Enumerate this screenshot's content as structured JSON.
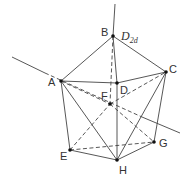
{
  "diagram": {
    "type": "polyhedron",
    "point_group_label": {
      "main": "D",
      "subscript": "2d"
    },
    "stroke_color": "#444444",
    "vertices": [
      {
        "id": "A",
        "label": "A",
        "x": 61,
        "y": 81,
        "lx": 48,
        "ly": 86
      },
      {
        "id": "B",
        "label": "B",
        "x": 113,
        "y": 36,
        "lx": 101,
        "ly": 36
      },
      {
        "id": "C",
        "label": "C",
        "x": 166,
        "y": 72,
        "lx": 169,
        "ly": 73
      },
      {
        "id": "D",
        "label": "D",
        "x": 117,
        "y": 83,
        "lx": 120,
        "ly": 94
      },
      {
        "id": "E",
        "label": "E",
        "x": 70,
        "y": 150,
        "lx": 60,
        "ly": 160
      },
      {
        "id": "F",
        "label": "F",
        "x": 110,
        "y": 104,
        "lx": 101,
        "ly": 100
      },
      {
        "id": "G",
        "label": "G",
        "x": 154,
        "y": 142,
        "lx": 159,
        "ly": 147
      },
      {
        "id": "H",
        "label": "H",
        "x": 117,
        "y": 160,
        "lx": 119,
        "ly": 174
      }
    ],
    "solid_edges": [
      [
        "A",
        "B"
      ],
      [
        "B",
        "C"
      ],
      [
        "A",
        "D"
      ],
      [
        "D",
        "C"
      ],
      [
        "B",
        "D"
      ],
      [
        "A",
        "E"
      ],
      [
        "A",
        "H"
      ],
      [
        "D",
        "H"
      ],
      [
        "E",
        "H"
      ],
      [
        "C",
        "H"
      ],
      [
        "C",
        "G"
      ],
      [
        "H",
        "G"
      ]
    ],
    "dashed_edges": [
      [
        "B",
        "F"
      ],
      [
        "A",
        "F"
      ],
      [
        "F",
        "G"
      ],
      [
        "E",
        "F"
      ],
      [
        "F",
        "C"
      ],
      [
        "E",
        "G"
      ]
    ],
    "axes": [
      {
        "name": "principal-axis",
        "solid": [
          [
            113,
            36
          ],
          [
            115,
            4
          ]
        ]
      },
      {
        "name": "c2-axis",
        "solid": [
          [
            12,
            57
          ],
          [
            45,
            73
          ]
        ],
        "dashed": [
          [
            45,
            73
          ],
          [
            142,
            117
          ]
        ],
        "solid2": [
          [
            142,
            117
          ],
          [
            180,
            133
          ]
        ]
      }
    ]
  }
}
